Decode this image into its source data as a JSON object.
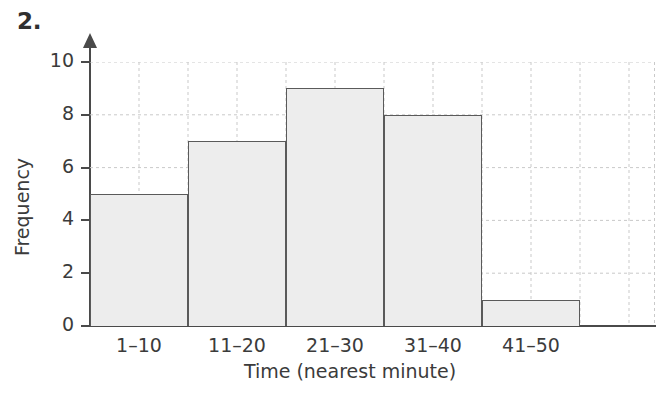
{
  "question": {
    "number": "2."
  },
  "chart_data": {
    "type": "bar",
    "title": "",
    "subtitle": "",
    "xlabel": "Time (nearest minute)",
    "ylabel": "Frequency",
    "categories": [
      "1–10",
      "11–20",
      "21–30",
      "31–40",
      "41–50"
    ],
    "values": [
      5,
      7,
      9,
      8,
      1
    ],
    "series": [
      {
        "name": "Frequency",
        "values": [
          5,
          7,
          9,
          8,
          1
        ]
      }
    ],
    "ylim": [
      0,
      10
    ],
    "y_ticks": [
      0,
      2,
      4,
      6,
      8,
      10
    ],
    "y_tick_labels": [
      "0",
      "2",
      "4",
      "6",
      "8",
      "10"
    ],
    "x_tick_labels": [
      "1–10",
      "11–20",
      "21–30",
      "31–40",
      "41–50"
    ],
    "grid": true,
    "grid_style": "dashed",
    "legend": false,
    "legend_position": "none",
    "annotations": [],
    "colors": {
      "bar_fill": "#ededed",
      "bar_stroke": "#5a5a5a",
      "axis": "#4a4a4a",
      "grid": "#c9c9c9",
      "text": "#3b3b3b",
      "background": "#ffffff"
    }
  }
}
